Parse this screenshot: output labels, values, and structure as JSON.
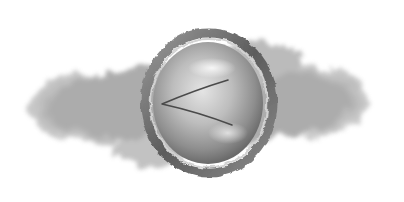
{
  "back_button": {
    "icon": "chevron-left-icon",
    "label": "",
    "style": "textured round medallion"
  },
  "colors": {
    "background": "#ffffff",
    "cloud": "#9a9a9a",
    "medallion_face": "#b8b8b8",
    "medallion_rim": "#6e6e6e",
    "chevron_stroke": "#4a4a4a"
  }
}
